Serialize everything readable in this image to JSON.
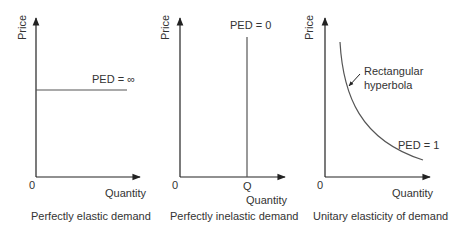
{
  "panels": [
    {
      "id": "perfectly-elastic",
      "y_axis_label": "Price",
      "x_axis_label": "Quantity",
      "origin_label": "0",
      "curve_label": "PED = ∞",
      "caption": "Perfectly elastic demand"
    },
    {
      "id": "perfectly-inelastic",
      "y_axis_label": "Price",
      "x_axis_label": "Quantity",
      "origin_label": "0",
      "q_label": "Q",
      "curve_label": "PED = 0",
      "caption": "Perfectly inelastic demand"
    },
    {
      "id": "unitary",
      "y_axis_label": "Price",
      "x_axis_label": "Quantity",
      "origin_label": "0",
      "annotation_line1": "Rectangular",
      "annotation_line2": "hyperbola",
      "curve_label": "PED = 1",
      "caption": "Unitary elasticity of demand"
    }
  ],
  "colors": {
    "axis": "#222222",
    "curve": "#555555",
    "text": "#333333"
  }
}
